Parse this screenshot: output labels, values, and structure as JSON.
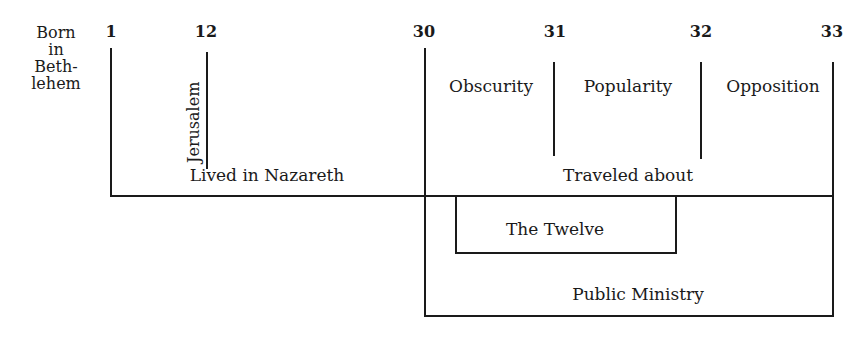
{
  "diagram": {
    "birth_label": [
      "Born",
      "in",
      "Beth-",
      "lehem"
    ],
    "years": [
      {
        "label": "1",
        "x": 111
      },
      {
        "label": "12",
        "x": 206
      },
      {
        "label": "30",
        "x": 424
      },
      {
        "label": "31",
        "x": 555
      },
      {
        "label": "32",
        "x": 701
      },
      {
        "label": "33",
        "x": 832
      }
    ],
    "periods": {
      "jerusalem": "Jerusalem",
      "nazareth": "Lived in Nazareth",
      "traveled": "Traveled about",
      "obscurity": "Obscurity",
      "popularity": "Popularity",
      "opposition": "Opposition",
      "twelve": "The Twelve",
      "ministry": "Public Ministry"
    },
    "line_color": "#1a1a1a"
  }
}
